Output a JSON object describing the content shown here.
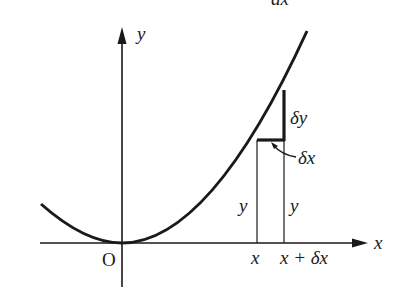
{
  "diagram": {
    "top_cropped_label": "dx",
    "axes": {
      "x_label": "x",
      "y_label": "y",
      "origin_label": "O"
    },
    "curve": "parabola y = kx^2",
    "annotations": {
      "delta_y": "δy",
      "delta_x": "δx",
      "height_left": "y",
      "height_right": "y",
      "tick_x": "x",
      "tick_x_plus_dx": "x + δx"
    },
    "colors": {
      "stroke": "#1a1a1a",
      "background": "#ffffff"
    }
  }
}
